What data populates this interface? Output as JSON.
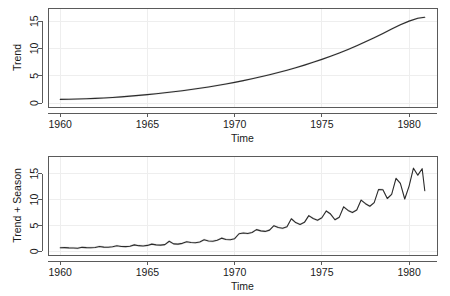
{
  "figure": {
    "background_color": "#ffffff",
    "line_color": "#2b2b2b",
    "band_color": "#cccccc",
    "frame_color": "#5a5a5a",
    "grid_color": "#eeeeee",
    "panels": [
      "trend",
      "trend_plus_season"
    ]
  },
  "chart_data": [
    {
      "type": "line",
      "title": "",
      "xlabel": "Time",
      "ylabel": "Trend",
      "xlim": [
        1959.3,
        1981.6
      ],
      "ylim": [
        -0.7,
        17.4
      ],
      "xticks": [
        1960,
        1965,
        1970,
        1975,
        1980
      ],
      "xticklabels": [
        "1960",
        "1965",
        "1970",
        "1975",
        "1980"
      ],
      "yticks": [
        0,
        5,
        10,
        15
      ],
      "yticklabels": [
        "0",
        "5",
        "10",
        "15"
      ],
      "grid": true,
      "legend": "none",
      "band": {
        "label": "uncertainty band",
        "half_width": 0.18
      },
      "x": [
        1960.0,
        1960.5,
        1961.0,
        1961.5,
        1962.0,
        1962.5,
        1963.0,
        1963.5,
        1964.0,
        1964.5,
        1965.0,
        1965.5,
        1966.0,
        1966.5,
        1967.0,
        1967.5,
        1968.0,
        1968.5,
        1969.0,
        1969.5,
        1970.0,
        1970.5,
        1971.0,
        1971.5,
        1972.0,
        1972.5,
        1973.0,
        1973.5,
        1974.0,
        1974.5,
        1975.0,
        1975.5,
        1976.0,
        1976.5,
        1977.0,
        1977.5,
        1978.0,
        1978.5,
        1979.0,
        1979.5,
        1980.0,
        1980.5,
        1980.9
      ],
      "y": [
        0.7,
        0.72,
        0.75,
        0.8,
        0.87,
        0.95,
        1.05,
        1.16,
        1.28,
        1.42,
        1.57,
        1.73,
        1.9,
        2.08,
        2.28,
        2.49,
        2.72,
        2.96,
        3.22,
        3.5,
        3.8,
        4.12,
        4.46,
        4.82,
        5.2,
        5.6,
        6.03,
        6.48,
        6.96,
        7.47,
        8.01,
        8.58,
        9.18,
        9.82,
        10.5,
        11.22,
        11.97,
        12.75,
        13.55,
        14.32,
        15.0,
        15.52,
        15.7
      ]
    },
    {
      "type": "line",
      "title": "",
      "xlabel": "Time",
      "ylabel": "Trend + Season",
      "xlim": [
        1959.3,
        1981.6
      ],
      "ylim": [
        -0.7,
        18.4
      ],
      "xticks": [
        1960,
        1965,
        1970,
        1975,
        1980
      ],
      "xticklabels": [
        "1960",
        "1965",
        "1970",
        "1975",
        "1980"
      ],
      "yticks": [
        0,
        5,
        10,
        15
      ],
      "yticklabels": [
        "0",
        "5",
        "10",
        "15"
      ],
      "grid": true,
      "legend": "none",
      "band": {
        "label": "uncertainty band",
        "half_width": 0.22
      },
      "x": [
        1960.0,
        1960.25,
        1960.5,
        1960.75,
        1961.0,
        1961.25,
        1961.5,
        1961.75,
        1962.0,
        1962.25,
        1962.5,
        1962.75,
        1963.0,
        1963.25,
        1963.5,
        1963.75,
        1964.0,
        1964.25,
        1964.5,
        1964.75,
        1965.0,
        1965.25,
        1965.5,
        1965.75,
        1966.0,
        1966.25,
        1966.5,
        1966.75,
        1967.0,
        1967.25,
        1967.5,
        1967.75,
        1968.0,
        1968.25,
        1968.5,
        1968.75,
        1969.0,
        1969.25,
        1969.5,
        1969.75,
        1970.0,
        1970.25,
        1970.5,
        1970.75,
        1971.0,
        1971.25,
        1971.5,
        1971.75,
        1972.0,
        1972.25,
        1972.5,
        1972.75,
        1973.0,
        1973.25,
        1973.5,
        1973.75,
        1974.0,
        1974.25,
        1974.5,
        1974.75,
        1975.0,
        1975.25,
        1975.5,
        1975.75,
        1976.0,
        1976.25,
        1976.5,
        1976.75,
        1977.0,
        1977.25,
        1977.5,
        1977.75,
        1978.0,
        1978.25,
        1978.5,
        1978.75,
        1979.0,
        1979.25,
        1979.5,
        1979.75,
        1980.0,
        1980.25,
        1980.5,
        1980.75,
        1980.9
      ],
      "y": [
        0.7,
        0.72,
        0.68,
        0.66,
        0.6,
        0.78,
        0.72,
        0.7,
        0.75,
        0.95,
        0.82,
        0.8,
        0.88,
        1.08,
        0.95,
        0.92,
        1.0,
        1.25,
        1.1,
        1.05,
        1.15,
        1.4,
        1.25,
        1.2,
        1.3,
        1.95,
        1.45,
        1.4,
        1.55,
        1.85,
        1.7,
        1.65,
        1.8,
        2.25,
        2.0,
        1.95,
        2.15,
        2.55,
        2.3,
        2.25,
        2.45,
        3.4,
        3.55,
        3.45,
        3.65,
        4.2,
        3.95,
        3.85,
        4.1,
        4.95,
        4.6,
        4.45,
        4.75,
        6.3,
        5.55,
        5.2,
        5.6,
        6.9,
        6.35,
        6.0,
        6.5,
        7.8,
        7.2,
        6.1,
        6.6,
        8.6,
        7.9,
        7.5,
        8.0,
        9.9,
        9.2,
        8.7,
        9.4,
        11.95,
        11.9,
        10.2,
        11.0,
        14.1,
        13.1,
        10.1,
        12.6,
        16.05,
        14.7,
        15.95,
        11.7
      ]
    }
  ]
}
